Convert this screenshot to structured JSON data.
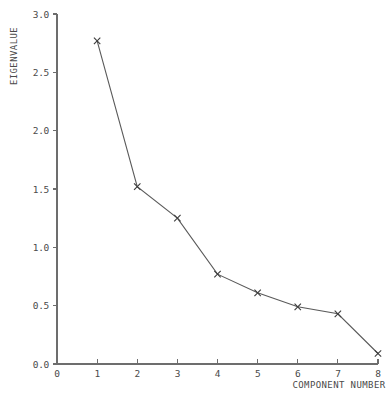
{
  "chart_data": {
    "type": "line",
    "title": "",
    "subtitle": "",
    "xlabel": "COMPONENT NUMBER",
    "ylabel": "EIGENVALUE",
    "xlim": [
      0,
      8
    ],
    "ylim": [
      0.0,
      3.0
    ],
    "grid": false,
    "legend": false,
    "legend_position": "none",
    "marker": "x",
    "x_ticks": [
      "0",
      "1",
      "2",
      "3",
      "4",
      "5",
      "6",
      "7",
      "8"
    ],
    "x_tick_values": [
      0,
      1,
      2,
      3,
      4,
      5,
      6,
      7,
      8
    ],
    "y_ticks": [
      "0.0",
      "0.5",
      "1.0",
      "1.5",
      "2.0",
      "2.5",
      "3.0"
    ],
    "y_tick_values": [
      0.0,
      0.5,
      1.0,
      1.5,
      2.0,
      2.5,
      3.0
    ],
    "categories": [
      1,
      2,
      3,
      4,
      5,
      6,
      7,
      8
    ],
    "x": [
      1,
      2,
      3,
      4,
      5,
      6,
      7,
      8
    ],
    "values": [
      2.77,
      1.52,
      1.25,
      0.77,
      0.61,
      0.49,
      0.43,
      0.09
    ],
    "series": [
      {
        "name": "Eigenvalue",
        "values": [
          2.77,
          1.52,
          1.25,
          0.77,
          0.61,
          0.49,
          0.43,
          0.09
        ]
      }
    ],
    "colors": {
      "line": "#5a5a5a",
      "marker": "#3c3c3c",
      "axis": "#6d6d6d",
      "text": "#4a4a4a",
      "background": "#ffffff"
    }
  }
}
